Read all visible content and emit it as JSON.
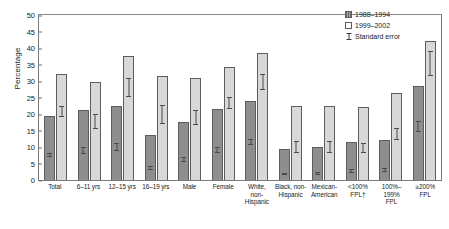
{
  "chart_data": {
    "type": "bar",
    "title": "",
    "xlabel": "",
    "ylabel": "Percentage",
    "ylim": [
      0,
      50
    ],
    "yticks": [
      0,
      5,
      10,
      15,
      20,
      25,
      30,
      35,
      40,
      45,
      50
    ],
    "grid": false,
    "legend_position": "top-right",
    "categories": [
      "Total",
      "6–11 yrs",
      "12–15 yrs",
      "16–19 yrs",
      "Male",
      "Female",
      "White, non-Hispanic",
      "Black, non-Hispanic",
      "Mexican-American",
      "<100% FPL†",
      "100%–199% FPL",
      "≥200% FPL"
    ],
    "category_lines": [
      [
        "Total"
      ],
      [
        "6–11 yrs"
      ],
      [
        "12–15 yrs"
      ],
      [
        "16–19 yrs"
      ],
      [
        "Male"
      ],
      [
        "Female"
      ],
      [
        "White, non-",
        "Hispanic"
      ],
      [
        "Black, non-",
        "Hispanic"
      ],
      [
        "Mexican-",
        "American"
      ],
      [
        "<100%",
        "FPL†"
      ],
      [
        "100%–199%",
        "FPL"
      ],
      [
        "≥200%",
        "FPL"
      ]
    ],
    "series": [
      {
        "name": "1988–1994",
        "color": "#8e8e8e",
        "values": [
          19.5,
          21.2,
          22.4,
          13.5,
          17.6,
          21.4,
          24.0,
          9.4,
          10.0,
          11.6,
          12.2,
          28.5
        ],
        "err_low": [
          17.8,
          18.9,
          19.6,
          11.7,
          15.8,
          19.2,
          22.2,
          7.6,
          8.2,
          9.4,
          9.6,
          25.6
        ],
        "err_high": [
          21.2,
          23.5,
          25.2,
          15.3,
          19.4,
          23.6,
          25.8,
          11.2,
          11.8,
          13.8,
          14.8,
          31.4
        ]
      },
      {
        "name": "1999–2002",
        "color": "#d8d8d6",
        "values": [
          32.2,
          29.8,
          37.5,
          31.5,
          30.8,
          34.2,
          38.5,
          22.4,
          22.4,
          22.0,
          26.4,
          42.0
        ],
        "err_low": [
          29.6,
          26.0,
          33.6,
          27.0,
          27.2,
          31.6,
          35.4,
          18.6,
          18.2,
          18.6,
          22.8,
          37.6
        ],
        "err_high": [
          34.8,
          33.6,
          41.4,
          36.0,
          34.4,
          36.8,
          41.6,
          26.2,
          26.6,
          25.4,
          30.0,
          46.4
        ]
      }
    ]
  },
  "legend": {
    "items": [
      {
        "label": "1988–1994",
        "marker": "filled-square"
      },
      {
        "label": "1999–2002",
        "marker": "open-square"
      },
      {
        "label": "Standard error",
        "marker": "i-beam"
      }
    ]
  }
}
